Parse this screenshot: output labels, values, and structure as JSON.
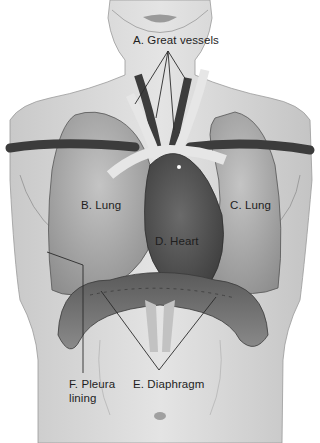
{
  "diagram": {
    "type": "anatomical-illustration",
    "labels": [
      {
        "id": "A",
        "text": "A. Great vessels"
      },
      {
        "id": "B",
        "text": "B. Lung"
      },
      {
        "id": "C",
        "text": "C. Lung"
      },
      {
        "id": "D",
        "text": "D. Heart"
      },
      {
        "id": "E",
        "text": "E. Diaphragm"
      },
      {
        "id": "F",
        "text_line1": "F. Pleura",
        "text_line2": "lining"
      }
    ],
    "colors": {
      "skin": "#d9d9d9",
      "skin_shadow": "#b8b8b8",
      "lung": "#a9a9a9",
      "heart": "#4a4a4a",
      "vessel_dark": "#3c3c3c",
      "vessel_light": "#e6e6e6",
      "diaphragm": "#6e6e6e",
      "leader_line": "#2a2a2a",
      "text": "#1e1e1e"
    }
  }
}
